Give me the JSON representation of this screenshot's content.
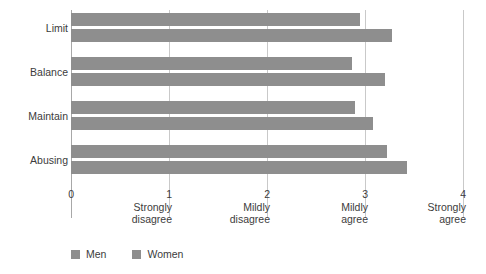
{
  "chart_data": {
    "type": "bar",
    "orientation": "horizontal",
    "title": "",
    "xlabel": "",
    "ylabel": "",
    "xlim": [
      0,
      4
    ],
    "grid": true,
    "legend_position": "bottom-left",
    "categories": [
      "Limit",
      "Balance",
      "Maintain",
      "Abusing"
    ],
    "series": [
      {
        "name": "Men",
        "color": "#8e8e8e",
        "values": [
          2.95,
          2.87,
          2.9,
          3.22
        ]
      },
      {
        "name": "Women",
        "color": "#8e8e8e",
        "values": [
          3.28,
          3.2,
          3.08,
          3.43
        ]
      }
    ],
    "x_ticks": [
      {
        "value": 0,
        "num": "0",
        "desc1": "",
        "desc2": ""
      },
      {
        "value": 1,
        "num": "1",
        "desc1": "Strongly",
        "desc2": "disagree"
      },
      {
        "value": 2,
        "num": "2",
        "desc1": "Mildly",
        "desc2": "disagree"
      },
      {
        "value": 3,
        "num": "3",
        "desc1": "Mildly",
        "desc2": "agree"
      },
      {
        "value": 4,
        "num": "4",
        "desc1": "Strongly",
        "desc2": "agree"
      }
    ]
  },
  "legend": {
    "items": [
      {
        "label": "Men",
        "color": "#8e8e8e"
      },
      {
        "label": "Women",
        "color": "#8e8e8e"
      }
    ]
  },
  "colors": {
    "bar": "#8e8e8e",
    "gridline": "#c9c9c9",
    "axis": "#a8a8a8",
    "text": "#3c3c3c",
    "background": "#ffffff"
  }
}
